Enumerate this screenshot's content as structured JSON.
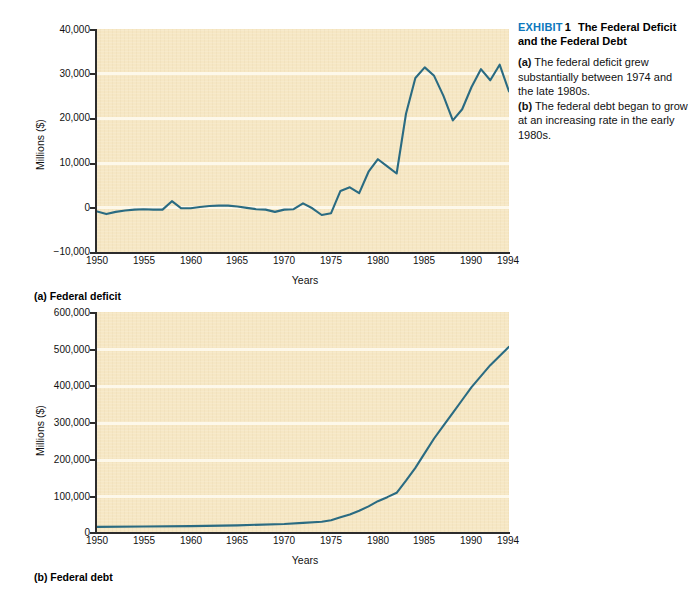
{
  "sidenote": {
    "exhibit_label": "EXHIBIT",
    "exhibit_number": "1",
    "exhibit_title": "The Federal Deficit and the Federal Debt",
    "note_a_marker": "(a)",
    "note_a_text": " The federal deficit grew substantially between 1974 and the late 1980s.",
    "note_b_marker": "(b)",
    "note_b_text": " The federal debt began to grow at an increasing rate in the early 1980s.",
    "accent_color": "#0d78bd"
  },
  "panel_a": {
    "caption": "(a) Federal deficit"
  },
  "panel_b": {
    "caption": "(b) Federal debt"
  },
  "colors": {
    "line": "#2a6b82",
    "plot_background": "#f6e7c4",
    "gridline": "#fdf8ea",
    "axis": "#2c2c2c"
  },
  "chart_data": [
    {
      "id": "federal-deficit",
      "type": "line",
      "title": "(a) Federal deficit",
      "xlabel": "Years",
      "ylabel": "Millions ($)",
      "xlim": [
        1950,
        1994
      ],
      "ylim": [
        -10000,
        40000
      ],
      "grid": true,
      "legend": "none",
      "xticks": [
        1950,
        1955,
        1960,
        1965,
        1970,
        1975,
        1980,
        1985,
        1990,
        1994
      ],
      "xtick_labels": [
        "1950",
        "1955",
        "1960",
        "1965",
        "1970",
        "1975",
        "1980",
        "1985",
        "1990",
        "1994"
      ],
      "yticks": [
        -10000,
        0,
        10000,
        20000,
        30000,
        40000
      ],
      "ytick_labels": [
        "−10,000",
        "0",
        "10,000",
        "20,000",
        "30,000",
        "40,000"
      ],
      "x": [
        1950,
        1951,
        1952,
        1953,
        1954,
        1955,
        1956,
        1957,
        1958,
        1959,
        1960,
        1961,
        1962,
        1963,
        1964,
        1965,
        1966,
        1967,
        1968,
        1969,
        1970,
        1971,
        1972,
        1973,
        1974,
        1975,
        1976,
        1977,
        1978,
        1979,
        1980,
        1981,
        1982,
        1983,
        1984,
        1985,
        1986,
        1987,
        1988,
        1989,
        1990,
        1991,
        1992,
        1993,
        1994
      ],
      "y": [
        -900,
        -1500,
        -1000,
        -700,
        -500,
        -400,
        -500,
        -500,
        1400,
        -200,
        -200,
        100,
        300,
        400,
        400,
        200,
        -100,
        -400,
        -500,
        -1000,
        -500,
        -400,
        900,
        -200,
        -1700,
        -1300,
        3700,
        4500,
        3200,
        8000,
        10800,
        9200,
        7600,
        21000,
        29000,
        31400,
        29500,
        25000,
        19500,
        22000,
        27000,
        31000,
        28500,
        32000,
        26000
      ],
      "annotations": []
    },
    {
      "id": "federal-debt",
      "type": "line",
      "title": "(b) Federal debt",
      "xlabel": "Years",
      "ylabel": "Millions ($)",
      "xlim": [
        1950,
        1994
      ],
      "ylim": [
        0,
        600000
      ],
      "grid": true,
      "legend": "none",
      "xticks": [
        1950,
        1955,
        1960,
        1965,
        1970,
        1975,
        1980,
        1985,
        1990,
        1994
      ],
      "xtick_labels": [
        "1950",
        "1955",
        "1960",
        "1965",
        "1970",
        "1975",
        "1980",
        "1985",
        "1990",
        "1994"
      ],
      "yticks": [
        0,
        100000,
        200000,
        300000,
        400000,
        500000,
        600000
      ],
      "ytick_labels": [
        "0",
        "100,000",
        "200,000",
        "300,000",
        "400,000",
        "500,000",
        "600,000"
      ],
      "x": [
        1950,
        1955,
        1960,
        1965,
        1970,
        1972,
        1974,
        1975,
        1976,
        1977,
        1978,
        1979,
        1980,
        1981,
        1982,
        1983,
        1984,
        1985,
        1986,
        1987,
        1988,
        1989,
        1990,
        1991,
        1992,
        1993,
        1994
      ],
      "y": [
        14000,
        15000,
        16000,
        18000,
        22000,
        25000,
        28000,
        32000,
        40000,
        48000,
        58000,
        70000,
        84000,
        95000,
        107000,
        140000,
        175000,
        215000,
        255000,
        290000,
        325000,
        360000,
        395000,
        425000,
        455000,
        480000,
        505000
      ],
      "annotations": []
    }
  ]
}
